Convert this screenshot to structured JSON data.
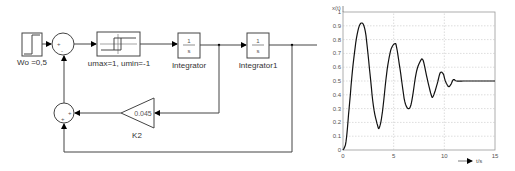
{
  "diagram": {
    "step": {
      "label": "Wo =0,5"
    },
    "sum1": {
      "signs": [
        "+",
        "-"
      ]
    },
    "relay": {
      "label": "umax=1, umin=-1"
    },
    "integrator": {
      "numerator": "1",
      "denominator": "s",
      "label": "Integrator"
    },
    "integrator1": {
      "numerator": "1",
      "denominator": "s",
      "label": "Integrator1"
    },
    "gain": {
      "value": "0.045",
      "label": "K2"
    },
    "sum2": {
      "signs": [
        "+",
        "+"
      ]
    }
  },
  "chart_data": {
    "type": "line",
    "title": "",
    "ylabel": "x(t)",
    "xlabel": "t/s",
    "xlim": [
      0,
      15
    ],
    "ylim": [
      0,
      1
    ],
    "x_ticks": [
      "0",
      "5",
      "10",
      "15"
    ],
    "y_ticks": [
      "0",
      "0.1",
      "0.2",
      "0.3",
      "0.4",
      "0.5",
      "0.6",
      "0.7",
      "0.8",
      "0.9",
      "1"
    ],
    "grid": true,
    "series": [
      {
        "name": "x(t)",
        "x": [
          0,
          0.3,
          0.6,
          1.0,
          1.4,
          1.8,
          2.2,
          2.6,
          3.0,
          3.4,
          3.6,
          3.9,
          4.3,
          4.7,
          5.1,
          5.3,
          5.7,
          6.1,
          6.5,
          6.8,
          7.2,
          7.6,
          7.9,
          8.3,
          8.7,
          8.9,
          9.3,
          9.6,
          9.9,
          10.1,
          10.4,
          10.6,
          10.9,
          11.2,
          12,
          13,
          14,
          15
        ],
        "values": [
          0,
          0.06,
          0.3,
          0.62,
          0.84,
          0.92,
          0.86,
          0.6,
          0.32,
          0.18,
          0.165,
          0.28,
          0.55,
          0.72,
          0.77,
          0.74,
          0.55,
          0.35,
          0.3,
          0.36,
          0.55,
          0.64,
          0.65,
          0.52,
          0.4,
          0.39,
          0.48,
          0.56,
          0.55,
          0.5,
          0.46,
          0.47,
          0.51,
          0.5,
          0.5,
          0.5,
          0.5,
          0.5
        ]
      }
    ]
  }
}
